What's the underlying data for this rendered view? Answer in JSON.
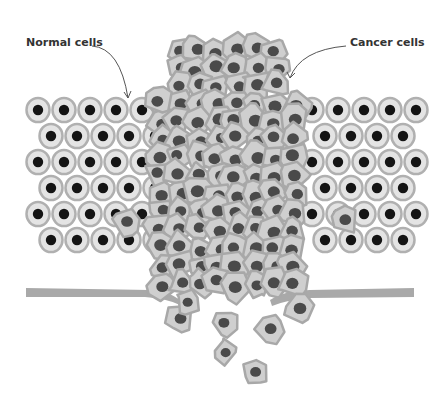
{
  "figure": {
    "labels": {
      "normal": "Normal cells",
      "cancer": "Cancer cells"
    },
    "colors": {
      "background": "#ffffff",
      "normal_cell_fill": "#e4e4e4",
      "normal_cell_stroke": "#b0b0b0",
      "normal_nucleus": "#141414",
      "cancer_cell_fill": "#cfcfcf",
      "cancer_cell_stroke": "#a8a8a8",
      "cancer_nucleus": "#4a4a4a",
      "membrane": "#a9a9a9",
      "label_text": "#333333",
      "arrow": "#555555"
    },
    "tissue": {
      "left_region": [
        26,
        145
      ],
      "right_region": [
        300,
        414
      ],
      "rows_top": 95,
      "row_count": 6,
      "row_height": 26
    }
  }
}
